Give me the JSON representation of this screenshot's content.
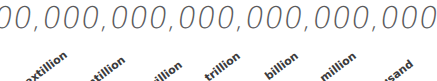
{
  "figure": {
    "kind": "place-value-annotated-number",
    "background_color": "#ffffff",
    "number": {
      "text": "6,600,000,000,000,000,000,000",
      "color": "#5a5a5c"
    },
    "labels": {
      "color": "#3b3b3d",
      "rotation_degrees": -37,
      "items": [
        {
          "label": "sextillion",
          "right": 66,
          "top": 47
        },
        {
          "label": "quintillion",
          "right": 124,
          "top": 52
        },
        {
          "label": "quadrillion",
          "right": 181,
          "top": 57
        },
        {
          "label": "trillion",
          "right": 239,
          "top": 48
        },
        {
          "label": "billion",
          "right": 297,
          "top": 48
        },
        {
          "label": "million",
          "right": 355,
          "top": 48
        },
        {
          "label": "thousand",
          "right": 412,
          "top": 56
        }
      ]
    }
  }
}
